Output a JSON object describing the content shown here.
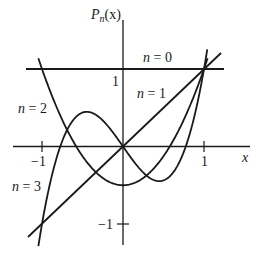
{
  "chart_data": {
    "type": "line",
    "title": "",
    "xlabel": "x",
    "ylabel": "P_n(x)",
    "xlim": [
      -1.3,
      1.5
    ],
    "ylim": [
      -1.25,
      1.5
    ],
    "grid": false,
    "x_ticks": [
      {
        "value": -1,
        "label": "−1"
      },
      {
        "value": 1,
        "label": "1"
      }
    ],
    "y_ticks": [
      {
        "value": 1,
        "label": "1"
      },
      {
        "value": -1,
        "label": "−1"
      }
    ],
    "series": [
      {
        "name": "n = 0",
        "formula": "1",
        "x": [
          -1.2,
          1.25
        ],
        "values": [
          1,
          1
        ]
      },
      {
        "name": "n = 1",
        "formula": "x",
        "x": [
          -1.17,
          1.22
        ],
        "values": [
          -1.17,
          1.22
        ]
      },
      {
        "name": "n = 2",
        "formula": "(3x^2-1)/2",
        "x": [
          -1.05,
          -0.5,
          0,
          0.5,
          1,
          1.05
        ],
        "values": [
          1.15,
          -0.125,
          -0.5,
          -0.125,
          1,
          1.15
        ]
      },
      {
        "name": "n = 3",
        "formula": "(5x^3-3x)/2",
        "x": [
          -1.05,
          -0.775,
          -0.447,
          0,
          0.447,
          0.775,
          1,
          1.04
        ],
        "values": [
          -1.32,
          0,
          0.447,
          0,
          -0.447,
          0,
          1,
          1.25
        ]
      }
    ],
    "legend": {
      "position": "inline-labels"
    }
  },
  "labels": {
    "y_axis": "P",
    "y_axis_sub": "n",
    "y_axis_arg": "(x)",
    "x_axis": "x",
    "tick_x_neg1": "−1",
    "tick_x_1": "1",
    "tick_y_1": "1",
    "tick_y_neg1": "−1",
    "n0": "n = 0",
    "n1": "n = 1",
    "n2": "n = 2",
    "n3": "n = 3"
  }
}
